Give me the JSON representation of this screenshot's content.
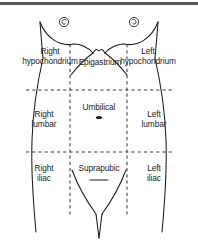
{
  "figure": {
    "background_color": "#ffffff",
    "line_color": "#1a1a1a",
    "band_color": "#5a5a5a",
    "width": 198,
    "height": 242
  },
  "regions": {
    "right_hypochondrium": "Right\nhypochondrium",
    "right_hypochondrium_line1": "Right",
    "right_hypochondrium_line2": "hypochondrium",
    "epigastrium": "Epigastrium",
    "left_hypochondrium_line1": "Left",
    "left_hypochondrium_line2": "hypochondrium",
    "right_lumbar_line1": "Right",
    "right_lumbar_line2": "lumbar",
    "umbilical": "Umbilical",
    "left_lumbar_line1": "Left",
    "left_lumbar_line2": "lumbar",
    "right_iliac_line1": "Right",
    "right_iliac_line2": "iliac",
    "suprapubic": "Suprapubic",
    "left_iliac_line1": "Left",
    "left_iliac_line2": "iliac"
  },
  "markers": {
    "right_nipple": "nipple-icon",
    "left_nipple": "nipple-icon",
    "umbilicus": "navel-icon",
    "pubic": "pubic-mark-icon"
  },
  "grid": {
    "vertical_left_x": 70,
    "vertical_right_x": 127,
    "horizontal_upper_y": 90,
    "horizontal_lower_y": 152,
    "style": "dashed"
  }
}
